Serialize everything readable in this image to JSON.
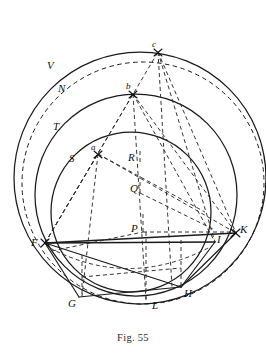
{
  "figure": {
    "caption": "Fig. 55",
    "caption_position": {
      "y": 332
    },
    "background_color": "#ffffff",
    "ink_color": "#1a1a1a",
    "canvas": {
      "width": 266,
      "height": 356
    }
  },
  "labels": [
    {
      "name": "label-V",
      "text": "V",
      "x": 47,
      "y": 60,
      "size": "normal"
    },
    {
      "name": "label-N",
      "text": "N",
      "x": 58,
      "y": 83,
      "size": "normal"
    },
    {
      "name": "label-T",
      "text": "T",
      "x": 53,
      "y": 121,
      "size": "normal"
    },
    {
      "name": "label-S",
      "text": "S",
      "x": 69,
      "y": 153,
      "size": "normal"
    },
    {
      "name": "label-c",
      "text": "c",
      "x": 152,
      "y": 44,
      "size": "small"
    },
    {
      "name": "label-b",
      "text": "b",
      "x": 127,
      "y": 86,
      "size": "small"
    },
    {
      "name": "label-a",
      "text": "a",
      "x": 92,
      "y": 147,
      "size": "small"
    },
    {
      "name": "label-R",
      "text": "R",
      "x": 130,
      "y": 157,
      "size": "normal"
    },
    {
      "name": "label-Q",
      "text": "Q",
      "x": 132,
      "y": 188,
      "size": "normal"
    },
    {
      "name": "label-P",
      "text": "P",
      "x": 133,
      "y": 227,
      "size": "normal"
    },
    {
      "name": "label-F",
      "text": "F",
      "x": 33,
      "y": 240,
      "size": "normal"
    },
    {
      "name": "label-I",
      "text": "I",
      "x": 217,
      "y": 237,
      "size": "normal"
    },
    {
      "name": "label-K",
      "text": "K",
      "x": 239,
      "y": 227,
      "size": "normal"
    },
    {
      "name": "label-H",
      "text": "H",
      "x": 184,
      "y": 291,
      "size": "normal"
    },
    {
      "name": "label-G",
      "text": "G",
      "x": 70,
      "y": 301,
      "size": "normal"
    },
    {
      "name": "label-L",
      "text": "L",
      "x": 152,
      "y": 303,
      "size": "normal"
    }
  ],
  "points": [
    {
      "name": "point-F",
      "label": "F",
      "x": 45,
      "y": 243
    },
    {
      "name": "point-I",
      "label": "I",
      "x": 214,
      "y": 242
    },
    {
      "name": "point-K",
      "label": "K",
      "x": 235,
      "y": 233
    },
    {
      "name": "point-a",
      "label": "a",
      "x": 98,
      "y": 154
    },
    {
      "name": "point-b",
      "label": "b",
      "x": 133,
      "y": 94
    },
    {
      "name": "point-c",
      "label": "c",
      "x": 158,
      "y": 52
    },
    {
      "name": "point-G",
      "label": "G",
      "x": 79,
      "y": 297
    },
    {
      "name": "point-H",
      "label": "H",
      "x": 181,
      "y": 287
    },
    {
      "name": "point-L",
      "label": "L",
      "x": 146,
      "y": 297
    },
    {
      "name": "point-P",
      "label": "P",
      "x": 143,
      "y": 232
    },
    {
      "name": "point-Q",
      "label": "Q",
      "x": 144,
      "y": 192
    },
    {
      "name": "point-R",
      "label": "R",
      "x": 141,
      "y": 161
    }
  ],
  "circles": [
    {
      "name": "circle-outer-V",
      "cx": 140,
      "cy": 178,
      "r": 126,
      "style": "solid"
    },
    {
      "name": "circle-dashed-N",
      "cx": 142,
      "cy": 182,
      "r": 121,
      "style": "dashed"
    },
    {
      "name": "circle-middle-T",
      "cx": 136,
      "cy": 195,
      "r": 101,
      "style": "solid"
    },
    {
      "name": "circle-inner-S",
      "cx": 131,
      "cy": 212,
      "r": 80,
      "style": "solid"
    }
  ],
  "chords_solid": [
    {
      "name": "chord-F-K",
      "from": "F",
      "to": "K"
    },
    {
      "name": "chord-F-I",
      "from": "F",
      "to": "I"
    },
    {
      "name": "chord-F-G",
      "from": "F",
      "to": "G"
    },
    {
      "name": "chord-F-H",
      "from": "F",
      "to": "H"
    },
    {
      "name": "chord-G-H",
      "from": "G",
      "to": "H"
    },
    {
      "name": "chord-H-I",
      "from": "H",
      "to": "I"
    },
    {
      "name": "chord-H-K",
      "from": "H",
      "to": "K"
    }
  ],
  "chords_dashed": [
    {
      "name": "dashed-F-a",
      "from": "F",
      "to": "a"
    },
    {
      "name": "dashed-F-b",
      "from": "F",
      "to": "b"
    },
    {
      "name": "dashed-F-c",
      "from": "F",
      "to": "c"
    },
    {
      "name": "dashed-a-K",
      "from": "a",
      "to": "K"
    },
    {
      "name": "dashed-b-K",
      "from": "b",
      "to": "K"
    },
    {
      "name": "dashed-c-K",
      "from": "c",
      "to": "K"
    },
    {
      "name": "dashed-b-I",
      "from": "b",
      "to": "I"
    },
    {
      "name": "dashed-c-I",
      "from": "c",
      "to": "I"
    },
    {
      "name": "dashed-a-R",
      "from": "a",
      "to": "R"
    },
    {
      "name": "dashed-a-G",
      "from": "a",
      "to": "G"
    },
    {
      "name": "dashed-b-L",
      "from": "b",
      "to": "L"
    },
    {
      "name": "dashed-c-L",
      "from": "c",
      "to": "L"
    },
    {
      "name": "dashed-P-K",
      "from": "P",
      "to": "K"
    },
    {
      "name": "dashed-Q-I",
      "from": "Q",
      "to": "I"
    },
    {
      "name": "dashed-F-P",
      "from": "F",
      "to": "P"
    },
    {
      "name": "dashed-vert-R-L",
      "from": "R",
      "to": "L"
    },
    {
      "name": "dashed-G-vert",
      "from": "G",
      "to": "Gtop"
    }
  ]
}
